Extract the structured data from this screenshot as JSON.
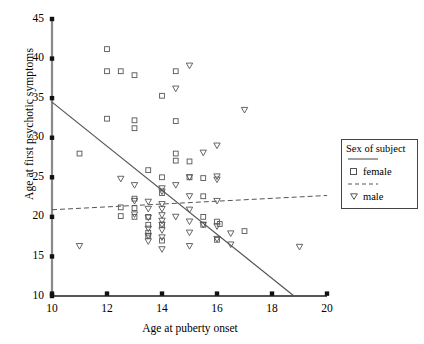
{
  "chart_data": {
    "type": "scatter",
    "title": "",
    "xlabel": "Age at puberty onset",
    "ylabel": "Age at first psychotic symptoms",
    "xlim": [
      10,
      20
    ],
    "ylim": [
      10,
      45
    ],
    "xticks": [
      10,
      12,
      14,
      16,
      18,
      20
    ],
    "yticks": [
      10,
      15,
      20,
      25,
      30,
      35,
      40,
      45
    ],
    "grid": false,
    "legend": {
      "title": "Sex of subject",
      "position": "right",
      "entries": [
        {
          "label": "female",
          "marker": "square",
          "line": "solid"
        },
        {
          "label": "male",
          "marker": "triangle-down",
          "line": "dashed"
        }
      ]
    },
    "series": [
      {
        "name": "female",
        "marker": "square",
        "color": "#555555",
        "points": [
          [
            12.0,
            41.2
          ],
          [
            12.0,
            38.4
          ],
          [
            12.5,
            38.4
          ],
          [
            13.0,
            37.9
          ],
          [
            14.5,
            38.4
          ],
          [
            14.0,
            35.3
          ],
          [
            12.0,
            32.4
          ],
          [
            13.0,
            32.2
          ],
          [
            13.0,
            31.2
          ],
          [
            14.5,
            32.1
          ],
          [
            11.0,
            28.0
          ],
          [
            14.5,
            28.0
          ],
          [
            14.5,
            27.1
          ],
          [
            15.0,
            27.0
          ],
          [
            13.5,
            25.9
          ],
          [
            14.0,
            25.0
          ],
          [
            15.0,
            25.0
          ],
          [
            15.5,
            24.9
          ],
          [
            13.0,
            22.3
          ],
          [
            14.0,
            23.0
          ],
          [
            15.5,
            22.6
          ],
          [
            12.5,
            21.2
          ],
          [
            13.0,
            21.1
          ],
          [
            12.5,
            20.1
          ],
          [
            13.0,
            20.0
          ],
          [
            13.5,
            20.0
          ],
          [
            15.5,
            20.0
          ],
          [
            16.0,
            19.4
          ],
          [
            16.1,
            19.1
          ],
          [
            13.5,
            19.0
          ],
          [
            14.0,
            19.0
          ],
          [
            15.5,
            19.0
          ],
          [
            17.0,
            18.2
          ],
          [
            13.5,
            18.0
          ],
          [
            13.5,
            17.6
          ],
          [
            14.0,
            17.0
          ],
          [
            16.0,
            17.1
          ]
        ]
      },
      {
        "name": "male",
        "marker": "triangle-down",
        "color": "#555555",
        "points": [
          [
            15.0,
            39.1
          ],
          [
            14.5,
            36.2
          ],
          [
            16.0,
            29.0
          ],
          [
            17.0,
            33.5
          ],
          [
            15.5,
            28.1
          ],
          [
            16.0,
            25.1
          ],
          [
            16.0,
            24.7
          ],
          [
            12.5,
            24.8
          ],
          [
            13.0,
            24.0
          ],
          [
            14.5,
            24.0
          ],
          [
            14.0,
            23.6
          ],
          [
            14.0,
            23.2
          ],
          [
            15.0,
            22.6
          ],
          [
            13.0,
            22.0
          ],
          [
            13.5,
            21.9
          ],
          [
            14.0,
            21.6
          ],
          [
            13.5,
            21.0
          ],
          [
            14.0,
            21.0
          ],
          [
            15.0,
            20.9
          ],
          [
            13.0,
            20.3
          ],
          [
            14.0,
            20.2
          ],
          [
            14.5,
            20.0
          ],
          [
            13.5,
            19.9
          ],
          [
            14.0,
            19.5
          ],
          [
            15.0,
            19.4
          ],
          [
            14.0,
            19.0
          ],
          [
            15.5,
            19.0
          ],
          [
            16.0,
            18.8
          ],
          [
            13.5,
            18.5
          ],
          [
            14.0,
            18.3
          ],
          [
            15.0,
            18.0
          ],
          [
            13.5,
            17.6
          ],
          [
            14.0,
            17.4
          ],
          [
            16.0,
            17.2
          ],
          [
            13.5,
            16.9
          ],
          [
            11.0,
            16.3
          ],
          [
            15.0,
            16.3
          ],
          [
            14.0,
            15.9
          ],
          [
            16.5,
            17.9
          ],
          [
            16.5,
            16.5
          ],
          [
            19.0,
            16.2
          ],
          [
            16.0,
            22.0
          ],
          [
            15.0,
            25.0
          ]
        ]
      }
    ],
    "fit_lines": [
      {
        "name": "female",
        "style": "solid",
        "x1": 10.0,
        "y1": 34.5,
        "x2": 18.8,
        "y2": 10.0
      },
      {
        "name": "male",
        "style": "dashed",
        "x1": 10.0,
        "y1": 20.9,
        "x2": 20.0,
        "y2": 22.7
      }
    ]
  },
  "axes": {
    "x_label": "Age at puberty onset",
    "y_label": "Age at first psychotic symptoms",
    "x_tick_labels": [
      "10",
      "12",
      "14",
      "16",
      "18",
      "20"
    ],
    "y_tick_labels": [
      "10",
      "15",
      "20",
      "25",
      "30",
      "35",
      "40",
      "45"
    ]
  },
  "legend": {
    "title": "Sex of subject",
    "female_label": "female",
    "male_label": "male"
  }
}
